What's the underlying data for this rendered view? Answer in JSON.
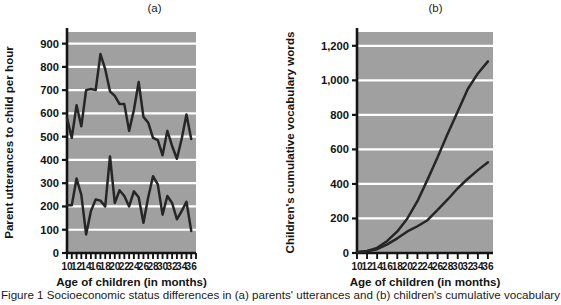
{
  "figure": {
    "caption_partial": "Figure 1 Socioeconomic status differences in (a) parents' utterances and (b) children's cumulative vocabulary"
  },
  "chart_data": [
    {
      "id": "a",
      "type": "line",
      "title": "(a)",
      "xlabel": "Age of children (in months)",
      "ylabel": "Parent utterances to child per hour",
      "xlim": [
        10,
        37
      ],
      "ylim": [
        0,
        950
      ],
      "yticks": [
        0,
        100,
        200,
        300,
        400,
        500,
        600,
        700,
        800,
        900
      ],
      "ytick_labels": [
        "0",
        "100",
        "200",
        "300",
        "400",
        "500",
        "600",
        "700",
        "800",
        "900"
      ],
      "xticks": [
        10,
        11,
        12,
        13,
        14,
        15,
        16,
        17,
        18,
        19,
        20,
        21,
        22,
        23,
        24,
        25,
        26,
        27,
        28,
        29,
        30,
        31,
        32,
        33,
        34,
        35,
        36,
        37
      ],
      "xtick_labels_shown": [
        "10",
        "12",
        "14",
        "16",
        "18",
        "20",
        "22",
        "24",
        "26",
        "28",
        "30",
        "32",
        "34",
        "36"
      ],
      "xtick_label_values": [
        10,
        12,
        14,
        16,
        18,
        20,
        22,
        24,
        26,
        28,
        30,
        32,
        34,
        36
      ],
      "grid": "horizontal",
      "plot_bg": "#a0a0a0",
      "grid_color": "#ffffff",
      "line_color": "#262626",
      "series": [
        {
          "name": "High SES parents",
          "x": [
            10,
            11,
            12,
            13,
            14,
            15,
            16,
            17,
            18,
            19,
            20,
            21,
            22,
            23,
            24,
            25,
            26,
            27,
            28,
            29,
            30,
            31,
            32,
            33,
            34,
            35,
            36
          ],
          "values": [
            580,
            495,
            635,
            545,
            700,
            705,
            700,
            855,
            790,
            695,
            675,
            640,
            640,
            525,
            615,
            735,
            585,
            560,
            495,
            485,
            420,
            525,
            460,
            405,
            490,
            595,
            490
          ]
        },
        {
          "name": "Low SES parents",
          "x": [
            10,
            11,
            12,
            13,
            14,
            15,
            16,
            17,
            18,
            19,
            20,
            21,
            22,
            23,
            24,
            25,
            26,
            27,
            28,
            29,
            30,
            31,
            32,
            33,
            34,
            35,
            36
          ],
          "values": [
            205,
            205,
            320,
            250,
            80,
            180,
            230,
            225,
            200,
            415,
            215,
            270,
            245,
            200,
            265,
            240,
            130,
            240,
            330,
            295,
            165,
            245,
            215,
            145,
            180,
            220,
            95
          ]
        }
      ]
    },
    {
      "id": "b",
      "type": "line",
      "title": "(b)",
      "xlabel": "Age of children (in months)",
      "ylabel": "Children's cumulative vocabulary words",
      "xlim": [
        10,
        37
      ],
      "ylim": [
        0,
        1280
      ],
      "yticks": [
        0,
        200,
        400,
        600,
        800,
        1000,
        1200
      ],
      "ytick_labels": [
        "0",
        "200",
        "400",
        "600",
        "800",
        "1,000",
        "1,200"
      ],
      "xticks": [
        10,
        12,
        14,
        16,
        18,
        20,
        22,
        24,
        26,
        28,
        30,
        32,
        34,
        36
      ],
      "xtick_labels_shown": [
        "10",
        "12",
        "14",
        "16",
        "18",
        "20",
        "22",
        "24",
        "26",
        "28",
        "30",
        "32",
        "34",
        "36"
      ],
      "xtick_label_values": [
        10,
        12,
        14,
        16,
        18,
        20,
        22,
        24,
        26,
        28,
        30,
        32,
        34,
        36
      ],
      "grid": "horizontal",
      "plot_bg": "#a0a0a0",
      "grid_color": "#ffffff",
      "line_color": "#262626",
      "series": [
        {
          "name": "High SES children",
          "x": [
            10,
            12,
            14,
            16,
            18,
            20,
            22,
            24,
            26,
            28,
            30,
            32,
            34,
            36
          ],
          "values": [
            5,
            12,
            30,
            70,
            125,
            200,
            300,
            425,
            555,
            690,
            820,
            950,
            1040,
            1110
          ]
        },
        {
          "name": "Low SES children",
          "x": [
            10,
            12,
            14,
            16,
            18,
            20,
            22,
            24,
            26,
            28,
            30,
            32,
            34,
            36
          ],
          "values": [
            5,
            10,
            22,
            50,
            85,
            125,
            155,
            190,
            250,
            310,
            375,
            430,
            480,
            525
          ]
        }
      ]
    }
  ]
}
